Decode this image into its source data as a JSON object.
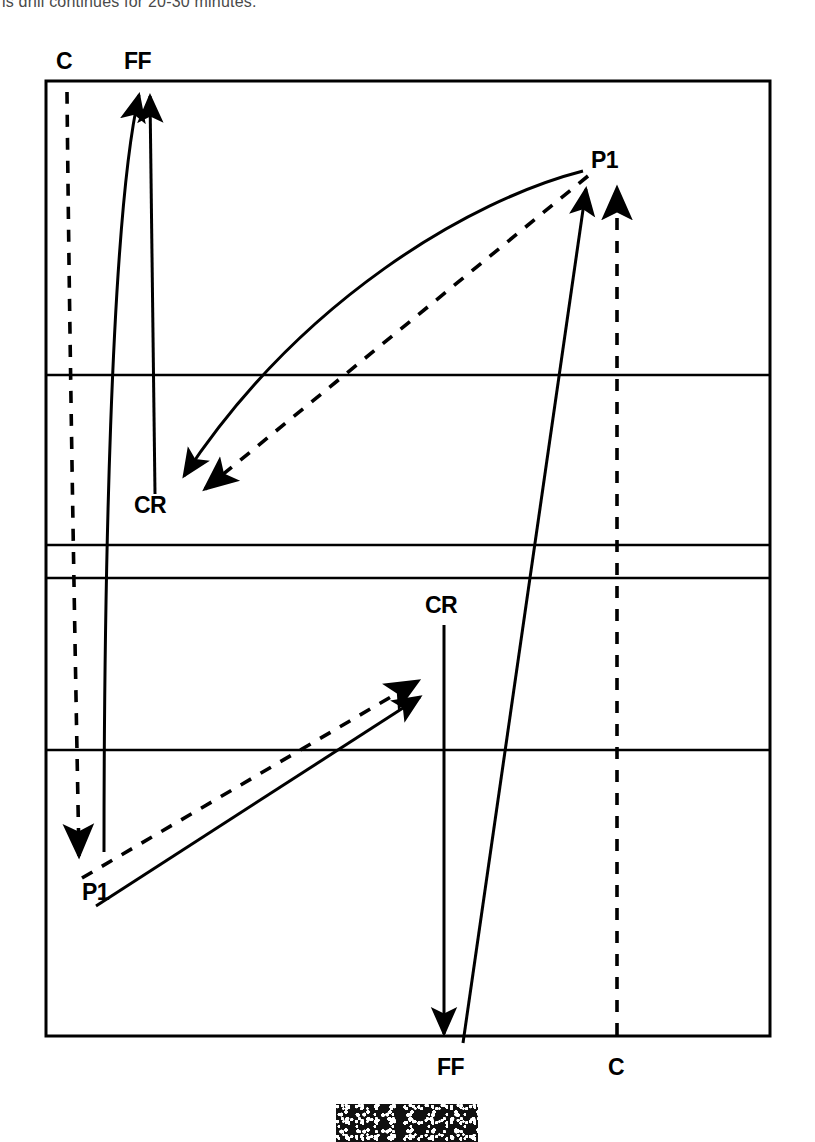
{
  "caption": {
    "text": "is drill continues for 20-30 minutes."
  },
  "diagram": {
    "colors": {
      "ink": "#000000",
      "background": "#ffffff"
    },
    "rink": {
      "left": 46,
      "top": 81,
      "right": 770,
      "bottom": 1036,
      "border_width": 3,
      "horizontal_lines_y": [
        375,
        545,
        578,
        750
      ]
    },
    "labels": {
      "top_left_c": "C",
      "top_left_ff": "FF",
      "upper_right_p1": "P1",
      "upper_left_cr": "CR",
      "lower_mid_cr": "CR",
      "lower_left_p1": "P1",
      "bottom_ff": "FF",
      "bottom_c": "C"
    },
    "label_positions": [
      {
        "name": "top-left-c",
        "text": "C",
        "x": 56,
        "y": 69,
        "anchor": "start"
      },
      {
        "name": "top-left-ff",
        "text": "FF",
        "x": 124,
        "y": 69,
        "anchor": "start"
      },
      {
        "name": "upper-right-p1",
        "text": "P1",
        "x": 591,
        "y": 168,
        "anchor": "start"
      },
      {
        "name": "upper-left-cr",
        "text": "CR",
        "x": 134,
        "y": 513,
        "anchor": "start"
      },
      {
        "name": "lower-mid-cr",
        "text": "CR",
        "x": 425,
        "y": 613,
        "anchor": "start"
      },
      {
        "name": "lower-left-p1",
        "text": "P1",
        "x": 82,
        "y": 900,
        "anchor": "start"
      },
      {
        "name": "bottom-ff",
        "text": "FF",
        "x": 437,
        "y": 1075,
        "anchor": "start"
      },
      {
        "name": "bottom-c",
        "text": "C",
        "x": 608,
        "y": 1075,
        "anchor": "start"
      }
    ],
    "paths": [
      {
        "name": "c-dashed-down-left",
        "style": "dashed",
        "arrow": "end",
        "d": "M 67 92 C 69 300, 74 600, 79 856"
      },
      {
        "name": "ff-curve-up-left",
        "style": "solid",
        "arrow": "end",
        "d": "M 104 852 C 104 600, 110 220, 139 95"
      },
      {
        "name": "ff-straight-up-left",
        "style": "solid",
        "arrow": "end",
        "d": "M 155 494 L 150 96"
      },
      {
        "name": "cr-curve-down-left-solid",
        "style": "solid",
        "arrow": "end",
        "d": "M 583 171 C 470 200, 300 300, 184 476"
      },
      {
        "name": "cr-line-down-left-dashed",
        "style": "dashed",
        "arrow": "end",
        "d": "M 588 176 L 205 489"
      },
      {
        "name": "p1-long-up-right-solid",
        "style": "solid",
        "arrow": "end",
        "d": "M 463 1043 L 586 189"
      },
      {
        "name": "c-dashed-up-right",
        "style": "dashed",
        "arrow": "end",
        "d": "M 617 1035 L 617 188"
      },
      {
        "name": "cr-down-to-ff-solid",
        "style": "solid",
        "arrow": "end",
        "d": "M 444 625 L 444 1034"
      },
      {
        "name": "p1-up-right-solid",
        "style": "solid",
        "arrow": "end",
        "d": "M 96 906 L 420 697"
      },
      {
        "name": "p1-up-right-dashed",
        "style": "dashed",
        "arrow": "end",
        "d": "M 82 878 L 418 681"
      }
    ]
  }
}
